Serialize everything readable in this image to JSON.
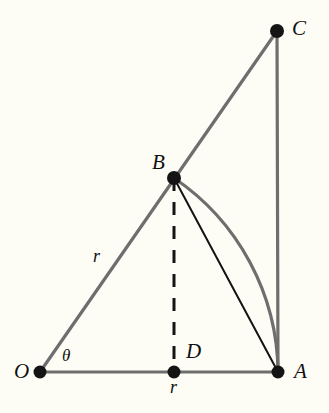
{
  "figure": {
    "width": 329,
    "height": 413,
    "background_color": "#fdfdf6",
    "line_color_gray": "#6e6e6e",
    "line_color_black": "#141414",
    "dot_color": "#141414"
  },
  "points": [
    {
      "id": "O",
      "label": "O",
      "x": 40,
      "y": 372,
      "label_x": 14,
      "label_y": 361
    },
    {
      "id": "A",
      "label": "A",
      "x": 278,
      "y": 372,
      "label_x": 294,
      "label_y": 361
    },
    {
      "id": "B",
      "label": "B",
      "x": 174,
      "y": 178,
      "label_x": 152,
      "label_y": 152
    },
    {
      "id": "C",
      "label": "C",
      "x": 277,
      "y": 31,
      "label_x": 292,
      "label_y": 18
    },
    {
      "id": "D",
      "label": "D",
      "x": 174,
      "y": 372,
      "label_x": 186,
      "label_y": 341
    }
  ],
  "measurements": [
    {
      "id": "radius-OB",
      "label": "r",
      "x": 93,
      "y": 247
    },
    {
      "id": "radius-OD",
      "label": "r",
      "x": 170,
      "y": 378
    },
    {
      "id": "angle-theta",
      "label": "θ",
      "x": 62,
      "y": 347
    }
  ],
  "segments": [
    {
      "id": "ray-OC",
      "from": "O",
      "to": "C",
      "style": "solid",
      "color": "gray",
      "width": 3.2
    },
    {
      "id": "base-OA",
      "from": "O",
      "to": "A",
      "style": "solid",
      "color": "gray",
      "width": 3.2
    },
    {
      "id": "side-CA",
      "from": "C",
      "to": "A",
      "style": "solid",
      "color": "gray",
      "width": 3.2
    },
    {
      "id": "chord-BA",
      "from": "B",
      "to": "A",
      "style": "solid",
      "color": "black",
      "width": 2.0
    },
    {
      "id": "height-BD",
      "from": "B",
      "to": "D",
      "style": "dashed",
      "color": "black",
      "width": 3.0
    }
  ],
  "arc": {
    "id": "arc-BA",
    "from": "B",
    "to": "A",
    "center": "O",
    "radius": 237,
    "color": "gray",
    "width": 3.2
  }
}
